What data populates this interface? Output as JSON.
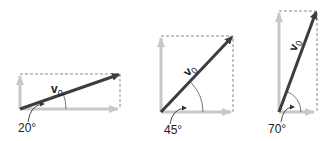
{
  "colors": {
    "vector": "#3d3d3d",
    "component": "#c8c8c8",
    "dashed": "#8a8a8a",
    "text": "#222222"
  },
  "panels": [
    {
      "angle_deg": 20,
      "angle_label": "20°",
      "vector_label": "v",
      "vector_sub": "0"
    },
    {
      "angle_deg": 45,
      "angle_label": "45°",
      "vector_label": "v",
      "vector_sub": "0"
    },
    {
      "angle_deg": 70,
      "angle_label": "70°",
      "vector_label": "v",
      "vector_sub": "0"
    }
  ]
}
